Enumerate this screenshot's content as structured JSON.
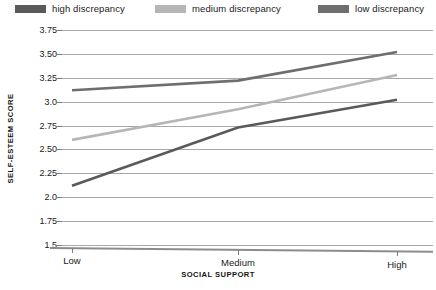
{
  "legend": {
    "position": "top",
    "items": [
      {
        "label": "high discrepancy",
        "color": "#5a5a5a",
        "key": "high"
      },
      {
        "label": "medium discrepancy",
        "color": "#b6b6b6",
        "key": "medium"
      },
      {
        "label": "low discrepancy",
        "color": "#6e6e6e",
        "key": "low"
      }
    ]
  },
  "axes": {
    "y_title": "SELF-ESTEEM SCORE",
    "x_title": "SOCIAL SUPPORT",
    "y_ticks": [
      "3.75",
      "3.50",
      "3.25",
      "3.0",
      "2.75",
      "2.50",
      "2.25",
      "2.0",
      "1.75",
      "1.5"
    ],
    "x_ticks": [
      "Low",
      "Medium",
      "High"
    ]
  },
  "chart_data": {
    "type": "line",
    "title": "",
    "subtitle": "",
    "xlabel": "SOCIAL SUPPORT",
    "ylabel": "SELF-ESTEEM SCORE",
    "categories": [
      "Low",
      "Medium",
      "High"
    ],
    "ylim": [
      1.5,
      3.75
    ],
    "ytick_values": [
      3.75,
      3.5,
      3.25,
      3.0,
      2.75,
      2.5,
      2.25,
      2.0,
      1.75,
      1.5
    ],
    "grid": true,
    "legend_position": "top",
    "series": [
      {
        "name": "high discrepancy",
        "color": "#5a5a5a",
        "values": [
          2.12,
          2.73,
          3.02
        ]
      },
      {
        "name": "medium discrepancy",
        "color": "#b6b6b6",
        "values": [
          2.6,
          2.92,
          3.28
        ]
      },
      {
        "name": "low discrepancy",
        "color": "#6e6e6e",
        "values": [
          3.12,
          3.22,
          3.52
        ]
      }
    ]
  }
}
